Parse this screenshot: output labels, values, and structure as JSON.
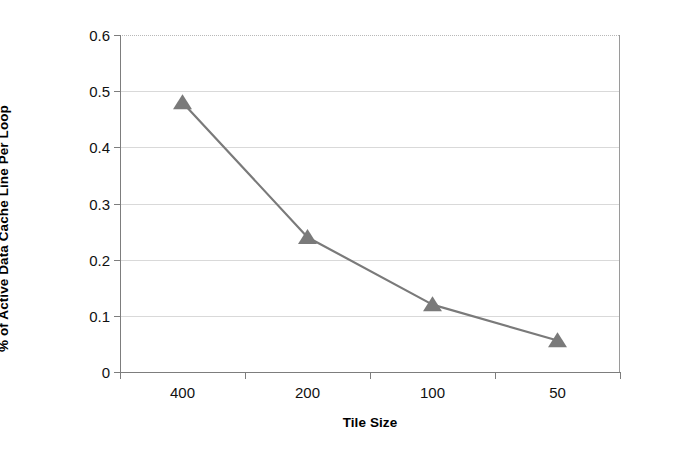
{
  "chart_data": {
    "type": "line",
    "title": "",
    "xlabel": "Tile Size",
    "ylabel": "% of Active Data Cache Line Per Loop",
    "categories": [
      "400",
      "200",
      "100",
      "50"
    ],
    "values": [
      0.48,
      0.24,
      0.12,
      0.056
    ],
    "series": [
      {
        "name": "% of Active Data Cache Line Per Loop",
        "values": [
          0.48,
          0.24,
          0.12,
          0.056
        ],
        "color": "#7a7a7a",
        "marker": "triangle"
      }
    ],
    "ylim": [
      0,
      0.6
    ],
    "ytick_labels": [
      "0",
      "0.1",
      "0.2",
      "0.3",
      "0.4",
      "0.5",
      "0.6"
    ],
    "ytick_values": [
      0,
      0.1,
      0.2,
      0.3,
      0.4,
      0.5,
      0.6
    ],
    "xtick_labels": [
      "400",
      "200",
      "100",
      "50"
    ],
    "grid": true,
    "grid_axis": "y",
    "legend": false,
    "legend_position": "none",
    "line_color": "#7a7a7a",
    "marker_color": "#7a7a7a",
    "gridline_color": "#d9d9d9",
    "axis_color": "#7d7d7d",
    "background_color": "#ffffff"
  },
  "axes": {
    "y_title": "% of Active Data Cache Line Per Loop",
    "x_title": "Tile Size",
    "y_labels": [
      "0.6",
      "0.5",
      "0.4",
      "0.3",
      "0.2",
      "0.1",
      "0"
    ],
    "x_labels": [
      "400",
      "200",
      "100",
      "50"
    ]
  }
}
